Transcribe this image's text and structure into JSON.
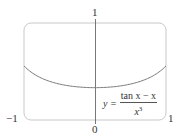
{
  "chart_data": {
    "type": "line",
    "title": "",
    "function": "y = (tan x - x) / x^3",
    "xlabel": "",
    "ylabel": "",
    "xlim": [
      -1,
      1
    ],
    "ylim": [
      0,
      1
    ],
    "x_ticks": [
      "-1",
      "0",
      "1"
    ],
    "y_ticks": [
      "1"
    ],
    "grid": false,
    "series": [
      {
        "name": "y = (tan x − x)/x³",
        "x": [
          -1.0,
          -0.75,
          -0.5,
          -0.25,
          0.0,
          0.25,
          0.5,
          0.75,
          1.0
        ],
        "y": [
          0.557,
          0.446,
          0.37,
          0.345,
          0.333,
          0.345,
          0.37,
          0.446,
          0.557
        ]
      }
    ],
    "annotation": {
      "lhs": "y =",
      "numerator": "tan x − x",
      "denominator": "x³"
    }
  },
  "labels": {
    "y_top": "1",
    "x_left": "−1",
    "x_origin": "0",
    "x_right": "1"
  },
  "formula": {
    "lhs": "y =",
    "numerator": "tan x − x",
    "denominator_base": "x",
    "denominator_exp": "3"
  },
  "colors": {
    "frame": "#c8c8c8",
    "axis": "#555555",
    "curve": "#7a7a7a"
  }
}
